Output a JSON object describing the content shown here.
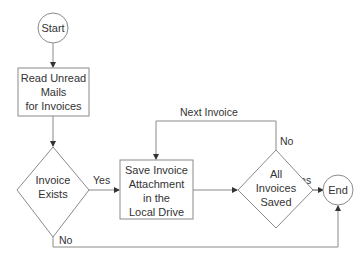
{
  "diagram": {
    "type": "flowchart",
    "colors": {
      "stroke": "#8a8a8a",
      "text": "#333333",
      "background": "#ffffff"
    },
    "nodes": {
      "start": {
        "shape": "circle",
        "label": "Start"
      },
      "read_mails": {
        "shape": "rectangle",
        "lines": [
          "Read Unread",
          "Mails",
          "for Invoices"
        ]
      },
      "invoice_exists": {
        "shape": "diamond",
        "lines": [
          "Invoice",
          "Exists"
        ]
      },
      "save_attachment": {
        "shape": "rectangle",
        "lines": [
          "Save Invoice",
          "Attachment",
          "in the",
          "Local Drive"
        ]
      },
      "all_saved": {
        "shape": "diamond",
        "lines": [
          "All",
          "Invoices",
          "Saved"
        ]
      },
      "end": {
        "shape": "circle",
        "label": "End"
      }
    },
    "edges": {
      "start_to_read": {
        "from": "start",
        "to": "read_mails",
        "label": ""
      },
      "read_to_exists": {
        "from": "read_mails",
        "to": "invoice_exists",
        "label": ""
      },
      "exists_yes": {
        "from": "invoice_exists",
        "to": "save_attachment",
        "label": "Yes"
      },
      "save_to_all": {
        "from": "save_attachment",
        "to": "all_saved",
        "label": ""
      },
      "all_no": {
        "from": "all_saved",
        "to": "save_attachment",
        "label": "No"
      },
      "next_invoice": {
        "label": "Next Invoice"
      },
      "all_yes": {
        "from": "all_saved",
        "to": "end",
        "label": "Yes"
      },
      "exists_no": {
        "from": "invoice_exists",
        "to": "end",
        "label": "No"
      }
    }
  }
}
